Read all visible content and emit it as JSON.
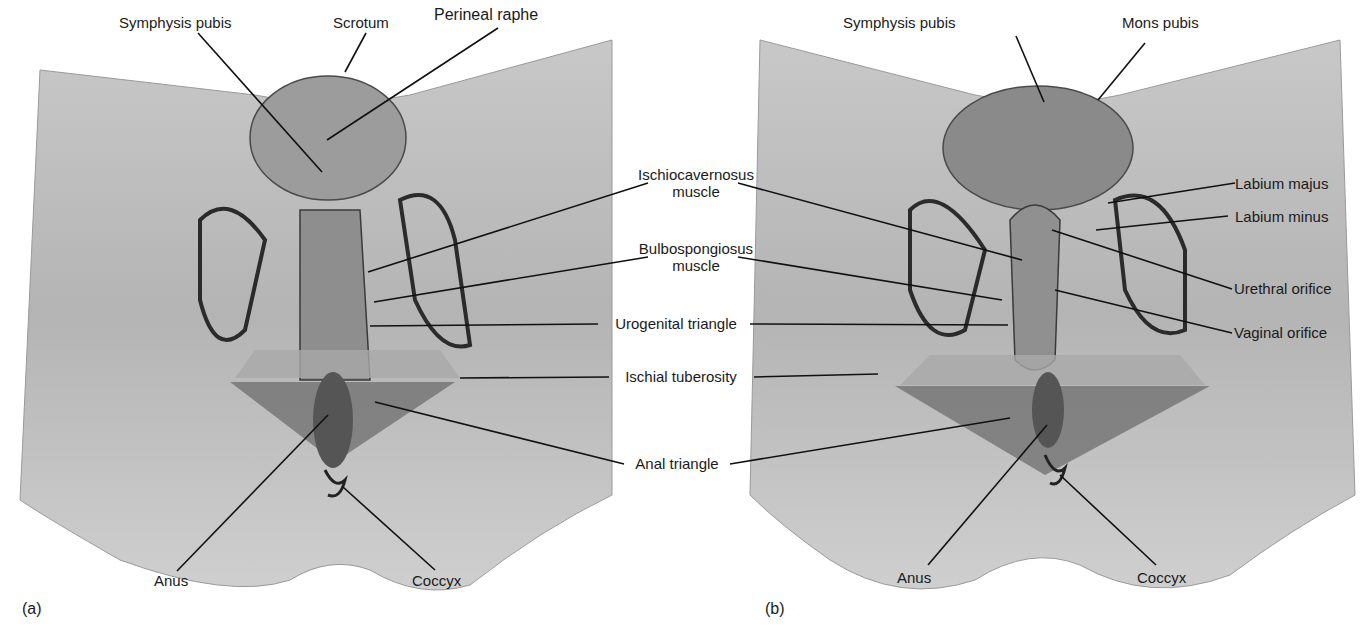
{
  "figure": {
    "panels": [
      {
        "id": "a",
        "letter": "(a)"
      },
      {
        "id": "b",
        "letter": "(b)"
      }
    ],
    "colors": {
      "background": "#ffffff",
      "region_fill": "#bdbdbd",
      "region_shade": "#9e9e9e",
      "triangle_fill": "#6e6e6e",
      "outline": "#2b2b2b",
      "leader_line": "#111111",
      "text": "#1a1a1a"
    }
  },
  "labels": {
    "a": {
      "symphysis_pubis": "Symphysis pubis",
      "scrotum": "Scrotum",
      "perineal_raphe": "Perineal raphe",
      "anus": "Anus",
      "coccyx": "Coccyx"
    },
    "shared": {
      "ischiocavernosus_1": "Ischiocavernosus",
      "ischiocavernosus_2": "muscle",
      "bulbospongiosus_1": "Bulbospongiosus",
      "bulbospongiosus_2": "muscle",
      "urogenital_triangle": "Urogenital triangle",
      "ischial_tuberosity": "Ischial tuberosity",
      "anal_triangle": "Anal triangle"
    },
    "b": {
      "symphysis_pubis": "Symphysis pubis",
      "mons_pubis": "Mons pubis",
      "labium_majus": "Labium majus",
      "labium_minus": "Labium minus",
      "urethral_orifice": "Urethral orifice",
      "vaginal_orifice": "Vaginal orifice",
      "anus": "Anus",
      "coccyx": "Coccyx"
    }
  }
}
